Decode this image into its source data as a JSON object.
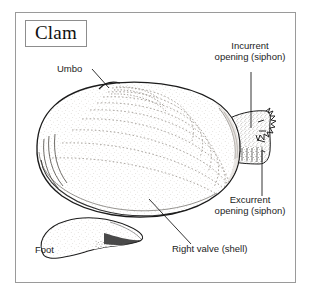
{
  "figure": {
    "title": "Clam",
    "kind": "labeled anatomical illustration",
    "border_color": "#9a9a9a",
    "ink_color": "#1c1c1c",
    "background": "#ffffff"
  },
  "labels": {
    "umbo": "Umbo",
    "incurrent": "Incurrent\nopening (siphon)",
    "excurrent": "Excurrent\nopening (siphon)",
    "right_valve": "Right valve (shell)",
    "foot": "Foot"
  },
  "parts": [
    {
      "name": "umbo",
      "label": "Umbo"
    },
    {
      "name": "incurrent-siphon",
      "label": "Incurrent opening (siphon)"
    },
    {
      "name": "excurrent-siphon",
      "label": "Excurrent opening (siphon)"
    },
    {
      "name": "right-valve",
      "label": "Right valve (shell)"
    },
    {
      "name": "foot",
      "label": "Foot"
    }
  ]
}
